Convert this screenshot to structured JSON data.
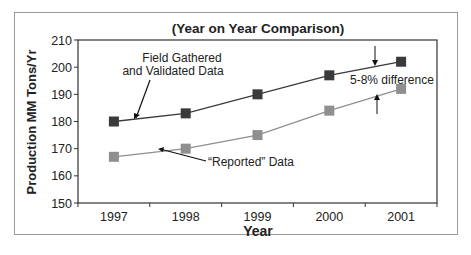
{
  "chart_data": {
    "type": "line",
    "title": "(Year on Year Comparison)",
    "xlabel": "Year",
    "ylabel": "Production MM Tons/Yr",
    "categories": [
      "1997",
      "1998",
      "1999",
      "2000",
      "2001"
    ],
    "ylim": [
      150,
      210
    ],
    "yticks": [
      150,
      160,
      170,
      180,
      190,
      200,
      210
    ],
    "grid": false,
    "legend": "none (inline annotations)",
    "series": [
      {
        "name": "Field Gathered and Validated Data",
        "color": "#3a3a3a",
        "values": [
          180,
          183,
          190,
          197,
          202
        ]
      },
      {
        "name": "“Reported” Data",
        "color": "#8f8f8f",
        "values": [
          167,
          170,
          175,
          184,
          192
        ]
      }
    ],
    "annotations": [
      {
        "text_lines": [
          "Field Gathered",
          "and Validated Data"
        ],
        "points_to": "Field Gathered and Validated Data"
      },
      {
        "text": "“Reported” Data",
        "points_to": "“Reported” Data"
      },
      {
        "text": "5-8% difference",
        "between_series_at": "2001"
      }
    ]
  }
}
